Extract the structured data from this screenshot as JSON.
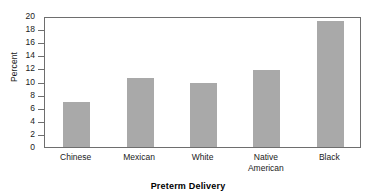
{
  "chart_data": {
    "type": "bar",
    "title": "Preterm Delivery",
    "title_position": "bottom",
    "xlabel": "",
    "ylabel": "Percent",
    "categories": [
      "Chinese",
      "Mexican",
      "White",
      "Native\nAmerican",
      "Black"
    ],
    "values": [
      6.9,
      10.5,
      9.8,
      11.8,
      19.3
    ],
    "ylim": [
      0,
      20
    ],
    "yticks": [
      0,
      2,
      4,
      6,
      8,
      10,
      12,
      14,
      16,
      18,
      20
    ],
    "ytick_labels": [
      "0",
      "2",
      "4",
      "6",
      "8",
      "10",
      "12",
      "14",
      "16",
      "18",
      "20"
    ],
    "grid": false,
    "legend": null,
    "bar_color": "#a9a9a9",
    "axis_color": "#6e6e6e",
    "background": "#ffffff"
  }
}
